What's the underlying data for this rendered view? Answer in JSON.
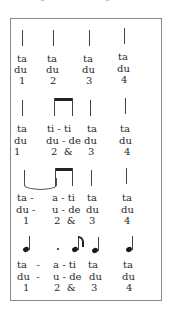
{
  "rows": [
    {
      "notation": "four quarter-note stems",
      "line1": [
        "ta",
        "ta",
        "ta",
        "ta"
      ],
      "line2": [
        "du",
        "du",
        "du",
        "du"
      ],
      "line3": [
        "1",
        "2",
        "3",
        "4"
      ]
    },
    {
      "notation": "quarter, two beamed eighths, quarter, quarter",
      "line1": [
        "ta",
        "ti - ti",
        "ta",
        "ta"
      ],
      "line2": [
        "du",
        "du - de",
        "du",
        "du"
      ],
      "line3": [
        "1",
        "2  &",
        "3",
        "4"
      ]
    },
    {
      "notation": "quarter tied to eighth (beamed with eighth), quarter, quarter",
      "line1": [
        "ta -",
        "a - ti",
        "ta",
        "ta"
      ],
      "line2": [
        "du -",
        "u - de",
        "du",
        "du"
      ],
      "line3": [
        "1",
        "2  &",
        "3",
        "4"
      ]
    },
    {
      "notation": "dotted quarter, eighth, quarter, quarter",
      "line1": [
        "ta   -",
        "a - ti",
        "ta",
        "ta"
      ],
      "line2": [
        "du  -",
        "u - de",
        "du",
        "du"
      ],
      "line3": [
        "1",
        "2  &",
        "3",
        "4"
      ]
    }
  ]
}
